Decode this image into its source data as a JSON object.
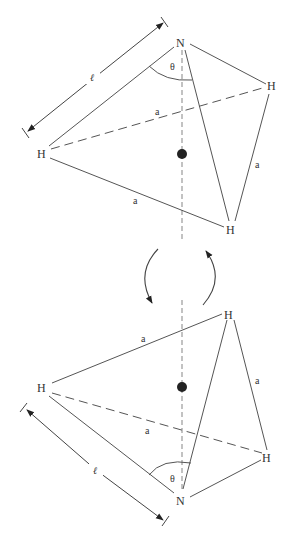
{
  "figure": {
    "colors": {
      "line": "#555555",
      "axis": "#9a9a9a",
      "center": "#222222",
      "text": "#333333",
      "background": "#ffffff"
    },
    "top_molecule": {
      "apex_label": "N",
      "h_labels": [
        "H",
        "H",
        "H"
      ],
      "edge_labels": [
        "a",
        "a",
        "a"
      ],
      "angle_label": "θ",
      "length_label": "ℓ"
    },
    "rotation": {
      "left_arrow": "counterclockwise-arc",
      "right_arrow": "clockwise-arc"
    },
    "bottom_molecule": {
      "apex_label": "N",
      "h_labels": [
        "H",
        "H",
        "H"
      ],
      "edge_labels": [
        "a",
        "a",
        "a"
      ],
      "angle_label": "θ",
      "length_label": "ℓ"
    }
  }
}
